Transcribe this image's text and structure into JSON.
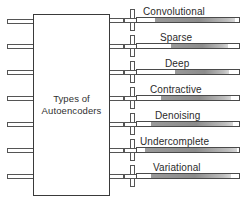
{
  "diagram": {
    "center_box": {
      "line1": "Types of",
      "line2": "Autoencoders"
    },
    "colors": {
      "stroke": "#555555",
      "box_stroke": "#3a3a3a",
      "text": "#2b2b2b",
      "bar_fill_dark": "#8c8c8c",
      "bar_fill_light": "#d6d6d6",
      "background": "#ffffff"
    },
    "left_stubs": [
      {
        "name": "input-stub-1",
        "top": 19
      },
      {
        "name": "input-stub-2",
        "top": 44
      },
      {
        "name": "input-stub-3",
        "top": 70
      },
      {
        "name": "input-stub-4",
        "top": 96
      },
      {
        "name": "input-stub-5",
        "top": 122
      },
      {
        "name": "input-stub-6",
        "top": 148
      },
      {
        "name": "input-stub-7",
        "top": 174
      }
    ],
    "branches": [
      {
        "id": "convolutional",
        "label": "Convolutional",
        "conn_top": 9,
        "line_y": 20,
        "lead_width": 14,
        "bar_left": 136,
        "bar_width": 104,
        "fill_start": 18,
        "fill_width": 80,
        "label_left": 143,
        "label_top": 6
      },
      {
        "id": "sparse",
        "label": "Sparse",
        "conn_top": 35,
        "line_y": 46,
        "lead_width": 14,
        "bar_left": 136,
        "bar_width": 104,
        "fill_start": 34,
        "fill_width": 57,
        "label_left": 160,
        "label_top": 32
      },
      {
        "id": "deep",
        "label": "Deep",
        "conn_top": 61,
        "line_y": 72,
        "lead_width": 14,
        "bar_left": 136,
        "bar_width": 104,
        "fill_start": 38,
        "fill_width": 54,
        "label_left": 165,
        "label_top": 58
      },
      {
        "id": "contractive",
        "label": "Contractive",
        "conn_top": 87,
        "line_y": 98,
        "lead_width": 14,
        "bar_left": 136,
        "bar_width": 104,
        "fill_start": 24,
        "fill_width": 70,
        "label_left": 150,
        "label_top": 84
      },
      {
        "id": "denoising",
        "label": "Denoising",
        "conn_top": 113,
        "line_y": 124,
        "lead_width": 14,
        "bar_left": 136,
        "bar_width": 104,
        "fill_start": 14,
        "fill_width": 82,
        "label_left": 155,
        "label_top": 110
      },
      {
        "id": "undercomplete",
        "label": "Undercomplete",
        "conn_top": 139,
        "line_y": 150,
        "lead_width": 14,
        "bar_left": 136,
        "bar_width": 104,
        "fill_start": 8,
        "fill_width": 92,
        "label_left": 140,
        "label_top": 136
      },
      {
        "id": "variational",
        "label": "Variational",
        "conn_top": 165,
        "line_y": 176,
        "lead_width": 14,
        "bar_left": 136,
        "bar_width": 104,
        "fill_start": 14,
        "fill_width": 80,
        "label_left": 153,
        "label_top": 162
      }
    ]
  }
}
